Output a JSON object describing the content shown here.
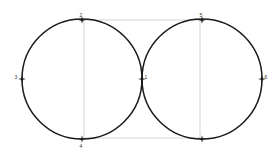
{
  "figure": {
    "title": "",
    "background_color": "#ffffff",
    "stroke_color": "#1a1a1a",
    "rect_color": "#c8c8c8",
    "label_color": "#333333",
    "width": 279,
    "height": 158
  },
  "chart_data": {
    "type": "scatter",
    "title": "",
    "xlabel": "",
    "ylabel": "",
    "grid": false,
    "legend": "none",
    "shapes": [
      {
        "kind": "circle",
        "name": "left-circle",
        "cx": 82,
        "cy": 79,
        "r": 60,
        "stroke": "#1a1a1a",
        "fill": "none"
      },
      {
        "kind": "circle",
        "name": "right-circle",
        "cx": 202,
        "cy": 79,
        "r": 60,
        "stroke": "#1a1a1a",
        "fill": "none"
      },
      {
        "kind": "rect",
        "name": "inscribed-rectangle",
        "x": 84,
        "y": 20,
        "width": 116,
        "height": 118,
        "stroke": "#c8c8c8",
        "fill": "none"
      }
    ],
    "points": [
      {
        "label": "1",
        "x": 142,
        "y": 79,
        "label_dx": 4,
        "label_dy": -1
      },
      {
        "label": "2",
        "x": 82,
        "y": 20,
        "label_dx": -1,
        "label_dy": -4
      },
      {
        "label": "3",
        "x": 22,
        "y": 79,
        "label_dx": -6,
        "label_dy": -1
      },
      {
        "label": "4",
        "x": 82,
        "y": 139,
        "label_dx": -1,
        "label_dy": 8
      },
      {
        "label": "5",
        "x": 202,
        "y": 20,
        "label_dx": -1,
        "label_dy": -4
      },
      {
        "label": "6",
        "x": 262,
        "y": 79,
        "label_dx": 4,
        "label_dy": -1
      },
      {
        "label": "",
        "x": 202,
        "y": 139,
        "label_dx": 0,
        "label_dy": 8
      }
    ],
    "point_marker": "cross-dot",
    "xlim": [
      0,
      279
    ],
    "ylim": [
      0,
      158
    ]
  }
}
